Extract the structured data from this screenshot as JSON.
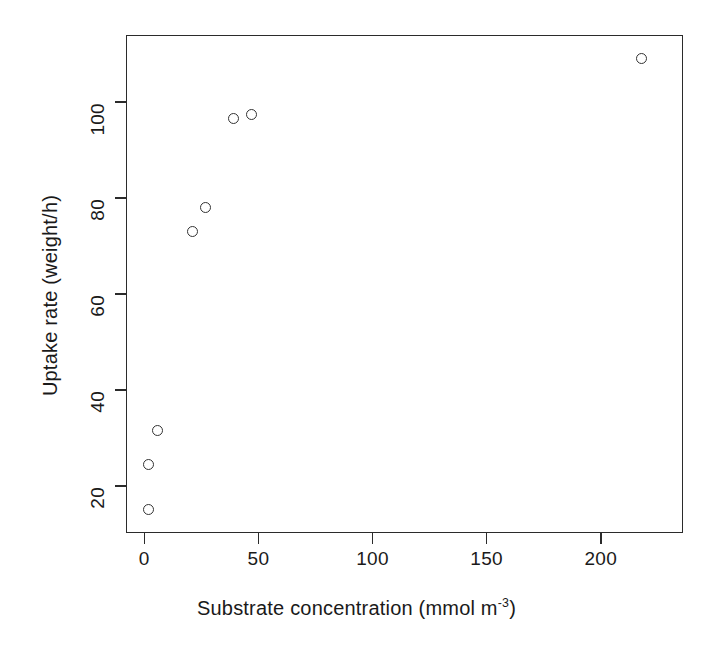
{
  "chart_data": {
    "type": "scatter",
    "title": "",
    "xlabel": "Substrate concentration (mmol m-3)",
    "xlabel_main": "Substrate concentration (mmol m",
    "xlabel_exponent": "-3",
    "xlabel_tail": ")",
    "ylabel": "Uptake rate (weight/h)",
    "xlim": [
      -8,
      236
    ],
    "ylim": [
      10.2,
      114.0
    ],
    "xticks": [
      0,
      50,
      100,
      150,
      200
    ],
    "xticklabels": [
      "0",
      "50",
      "100",
      "150",
      "200"
    ],
    "yticks": [
      20,
      40,
      60,
      80,
      100
    ],
    "yticklabels": [
      "20",
      "40",
      "60",
      "80",
      "100"
    ],
    "grid": false,
    "legend": "none",
    "marker": "open-circle",
    "marker_color": "#333333",
    "points": [
      {
        "x": 2.0,
        "y": 15.0
      },
      {
        "x": 2.0,
        "y": 24.5
      },
      {
        "x": 6.0,
        "y": 31.5
      },
      {
        "x": 21.0,
        "y": 73.0
      },
      {
        "x": 27.0,
        "y": 78.0
      },
      {
        "x": 39.0,
        "y": 96.5
      },
      {
        "x": 47.0,
        "y": 97.5
      },
      {
        "x": 218.0,
        "y": 109.0
      }
    ],
    "x_values": [
      2.0,
      2.0,
      6.0,
      21.0,
      27.0,
      39.0,
      47.0,
      218.0
    ],
    "y_values": [
      15.0,
      24.5,
      31.5,
      73.0,
      78.0,
      96.5,
      97.5,
      109.0
    ]
  },
  "axes": {
    "frame_color": "#2b2b2b",
    "background": "#ffffff"
  }
}
